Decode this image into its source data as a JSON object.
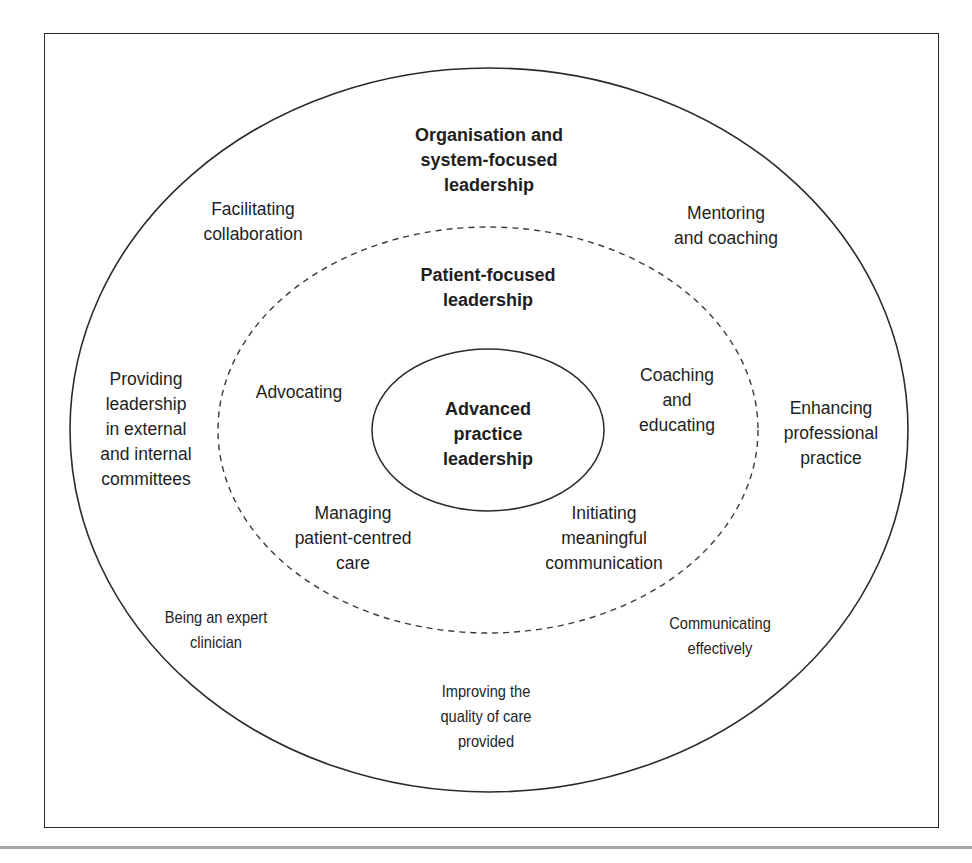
{
  "diagram": {
    "outer_ring": {
      "title": "Organisation and\nsystem-focused\nleadership",
      "items": [
        "Facilitating\ncollaboration",
        "Mentoring\nand coaching",
        "Providing\nleadership\nin external\nand internal\ncommittees",
        "Enhancing\nprofessional\npractice",
        "Being an expert\nclinician",
        "Communicating\neffectively",
        "Improving the\nquality of care\nprovided"
      ]
    },
    "middle_ring": {
      "title": "Patient-focused\nleadership",
      "items": [
        "Advocating",
        "Coaching\nand\neducating",
        "Managing\npatient-centred\ncare",
        "Initiating\nmeaningful\ncommunication"
      ]
    },
    "core": {
      "title": "Advanced\npractice\nleadership"
    },
    "colors": {
      "line": "#2a2a2a",
      "text": "#1e1e1e",
      "background": "#ffffff"
    }
  }
}
